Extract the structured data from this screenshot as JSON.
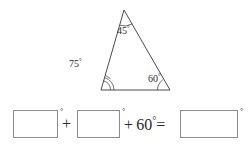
{
  "figure": {
    "shape_name": "triangle",
    "degree_symbol": "°",
    "angles": {
      "apex": {
        "value": "45",
        "label": "45°"
      },
      "left": {
        "value": "75",
        "label": "75°"
      },
      "right": {
        "value": "60",
        "label": "60°"
      }
    }
  },
  "equation": {
    "answer_boxes": [
      {
        "value": "",
        "placeholder": "",
        "unit": "°"
      },
      {
        "value": "",
        "placeholder": "",
        "unit": "°"
      },
      {
        "value": "",
        "placeholder": "",
        "unit": "°"
      }
    ],
    "plus_operator": "+",
    "middle_expression_prefix": "+ 60",
    "middle_expression_degree": "°",
    "equals_operator": "=",
    "known_term": "60"
  },
  "colors": {
    "stroke": "#4a4a4a",
    "box_border": "#8c8c8c",
    "text": "#2b2b2b",
    "background": "#ffffff"
  }
}
